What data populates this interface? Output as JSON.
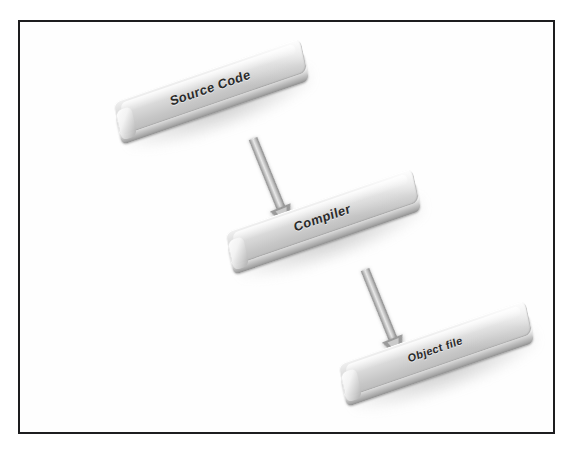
{
  "figure": {
    "type": "flow-diagram",
    "title": "",
    "background_color": "#ffffff",
    "frame_color": "#1d1d1f",
    "node_fill_color": "#d4d4d4",
    "arrow_color": "#9a9a9a",
    "label_color": "#2a2a2a"
  },
  "nodes": [
    {
      "id": "source-code",
      "label": "Source Code"
    },
    {
      "id": "compiler",
      "label": "Compiler"
    },
    {
      "id": "object-file",
      "label": "Object file"
    }
  ],
  "edges": [
    {
      "id": "source-to-compiler",
      "from": "Source Code",
      "to": "Compiler",
      "arrow": "down-right"
    },
    {
      "id": "compiler-to-object",
      "from": "Compiler",
      "to": "Object file",
      "arrow": "down-right"
    }
  ]
}
